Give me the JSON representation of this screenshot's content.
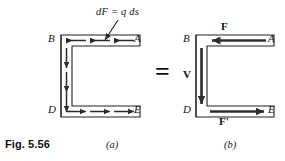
{
  "figure": {
    "caption": "Fig. 5.56",
    "panels": [
      {
        "id": "a",
        "sublabel": "(a)",
        "annotation": "dF = q ds",
        "vertices": {
          "top_left": "B",
          "top_right": "A",
          "bottom_left": "D",
          "bottom_right": "E"
        },
        "flow_arrows": {
          "top_direction": "left",
          "top_count": 3,
          "bottom_direction": "right",
          "bottom_count": 3,
          "left_direction": "down",
          "left_count": 3
        }
      },
      {
        "id": "b",
        "sublabel": "(b)",
        "vertices": {
          "top_left": "B",
          "top_right": "A",
          "bottom_left": "D",
          "bottom_right": "E"
        },
        "force_labels": {
          "top": "F",
          "bottom": "F'",
          "left": "V"
        },
        "resultant_arrows": {
          "top_direction": "left",
          "bottom_direction": "right",
          "left_direction": "down"
        }
      }
    ],
    "equals_symbol": "=",
    "colors": {
      "outline": "#222222",
      "arrow": "#2b2b2b",
      "bold_arrow": "#2e2e2e",
      "background": "#ffffff",
      "text": "#141414"
    }
  }
}
